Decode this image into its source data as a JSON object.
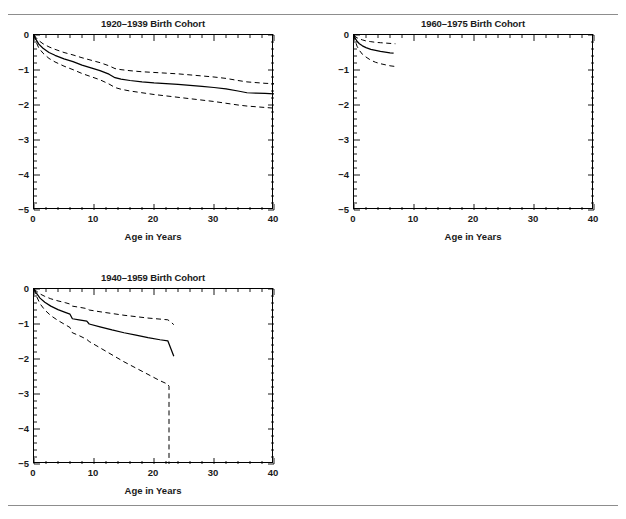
{
  "figure": {
    "top_fragment_text": "",
    "rules": {
      "color": "#8d8d8d"
    },
    "axis": {
      "xlabel": "Age in Years",
      "xticks": [
        0,
        10,
        20,
        30,
        40
      ],
      "xtick_labels": [
        "0",
        "10",
        "20",
        "30",
        "40"
      ],
      "yticks": [
        0,
        -1,
        -2,
        -3,
        -4,
        -5
      ],
      "ytick_labels": [
        "0",
        "−1",
        "−2",
        "−3",
        "−4",
        "−5"
      ],
      "xlim": [
        0,
        40
      ],
      "ylim": [
        -5,
        0
      ],
      "x_minor_per_major": 5,
      "y_minor_per_major": 5,
      "grid": false,
      "line_color": "#000000"
    }
  },
  "chart_data": [
    {
      "type": "line",
      "title": "1920–1939 Birth Cohort",
      "xlabel": "Age in Years",
      "ylabel": "",
      "xlim": [
        0,
        40
      ],
      "ylim": [
        -5,
        0
      ],
      "grid": false,
      "legend": "none",
      "series": [
        {
          "name": "estimate",
          "style": "solid",
          "x": [
            0,
            0.3,
            0.8,
            1.5,
            2.5,
            3.5,
            5,
            6.5,
            8,
            9.5,
            11,
            12.5,
            13.5,
            14.5,
            16,
            18,
            20,
            22,
            24,
            26,
            28,
            30,
            32,
            34,
            35.5,
            37,
            38.5,
            40
          ],
          "y": [
            0,
            -0.12,
            -0.26,
            -0.38,
            -0.5,
            -0.58,
            -0.68,
            -0.76,
            -0.86,
            -0.94,
            -1.02,
            -1.12,
            -1.22,
            -1.26,
            -1.3,
            -1.34,
            -1.37,
            -1.39,
            -1.41,
            -1.44,
            -1.47,
            -1.5,
            -1.54,
            -1.6,
            -1.65,
            -1.66,
            -1.67,
            -1.68
          ]
        },
        {
          "name": "upper_ci",
          "style": "dashed",
          "x": [
            0,
            0.3,
            0.8,
            1.5,
            2.5,
            3.5,
            5,
            6.5,
            8,
            9.5,
            11,
            12.5,
            13.5,
            14.5,
            16,
            18,
            20,
            22,
            24,
            26,
            28,
            30,
            32,
            34,
            35.5,
            37,
            38.5,
            40
          ],
          "y": [
            0,
            -0.07,
            -0.16,
            -0.25,
            -0.34,
            -0.41,
            -0.5,
            -0.57,
            -0.65,
            -0.72,
            -0.79,
            -0.88,
            -0.96,
            -0.99,
            -1.02,
            -1.05,
            -1.07,
            -1.09,
            -1.11,
            -1.14,
            -1.17,
            -1.2,
            -1.24,
            -1.3,
            -1.34,
            -1.36,
            -1.38,
            -1.39
          ]
        },
        {
          "name": "lower_ci",
          "style": "dashed",
          "x": [
            0,
            0.3,
            0.8,
            1.5,
            2.5,
            3.5,
            5,
            6.5,
            8,
            9.5,
            11,
            12.5,
            13.5,
            14.5,
            16,
            18,
            20,
            22,
            24,
            26,
            28,
            30,
            32,
            34,
            35.5,
            37,
            38.5,
            40
          ],
          "y": [
            0,
            -0.18,
            -0.37,
            -0.52,
            -0.67,
            -0.77,
            -0.89,
            -0.99,
            -1.1,
            -1.19,
            -1.28,
            -1.4,
            -1.5,
            -1.55,
            -1.6,
            -1.65,
            -1.7,
            -1.74,
            -1.78,
            -1.82,
            -1.86,
            -1.9,
            -1.95,
            -2.0,
            -2.03,
            -2.05,
            -2.07,
            -2.09
          ]
        }
      ]
    },
    {
      "type": "line",
      "title": "1960–1975 Birth Cohort",
      "xlabel": "Age in Years",
      "ylabel": "",
      "xlim": [
        0,
        40
      ],
      "ylim": [
        -5,
        0
      ],
      "grid": false,
      "legend": "none",
      "series": [
        {
          "name": "estimate",
          "style": "solid",
          "x": [
            0,
            0.2,
            0.5,
            0.9,
            1.4,
            2.0,
            2.8,
            3.6,
            4.4,
            5.2,
            6.0,
            6.6
          ],
          "y": [
            0,
            -0.09,
            -0.18,
            -0.25,
            -0.31,
            -0.36,
            -0.41,
            -0.44,
            -0.47,
            -0.49,
            -0.51,
            -0.52
          ]
        },
        {
          "name": "upper_ci",
          "style": "dashed",
          "x": [
            0,
            0.2,
            0.5,
            0.9,
            1.4,
            2.0,
            2.8,
            3.6,
            4.4,
            5.2,
            6.0,
            6.9
          ],
          "y": [
            0,
            -0.04,
            -0.08,
            -0.11,
            -0.14,
            -0.17,
            -0.19,
            -0.21,
            -0.22,
            -0.23,
            -0.24,
            -0.25
          ]
        },
        {
          "name": "lower_ci",
          "style": "dashed",
          "x": [
            0,
            0.2,
            0.5,
            0.9,
            1.4,
            2.0,
            2.8,
            3.6,
            4.4,
            5.2,
            6.0,
            6.9
          ],
          "y": [
            0,
            -0.16,
            -0.32,
            -0.44,
            -0.55,
            -0.63,
            -0.72,
            -0.78,
            -0.82,
            -0.85,
            -0.88,
            -0.9
          ]
        }
      ]
    },
    {
      "type": "line",
      "title": "1940–1959 Birth Cohort",
      "xlabel": "Age in Years",
      "ylabel": "",
      "xlim": [
        0,
        40
      ],
      "ylim": [
        -5,
        0
      ],
      "grid": false,
      "legend": "none",
      "series": [
        {
          "name": "estimate",
          "style": "solid",
          "x": [
            0,
            0.4,
            1.0,
            1.8,
            2.8,
            4.0,
            5.2,
            6.0,
            6.4,
            7.5,
            8.8,
            9.2,
            11,
            13,
            15,
            17,
            19,
            21,
            22.3,
            22.8,
            23.3
          ],
          "y": [
            0,
            -0.12,
            -0.26,
            -0.38,
            -0.49,
            -0.59,
            -0.67,
            -0.72,
            -0.85,
            -0.88,
            -0.92,
            -1.0,
            -1.08,
            -1.17,
            -1.25,
            -1.32,
            -1.39,
            -1.45,
            -1.48,
            -1.7,
            -1.92
          ]
        },
        {
          "name": "upper_ci",
          "style": "dashed",
          "x": [
            0,
            0.4,
            1.0,
            1.8,
            2.8,
            4.0,
            5.2,
            6.0,
            6.4,
            7.5,
            8.8,
            9.2,
            11,
            13,
            15,
            17,
            19,
            21,
            22.3,
            22.8,
            23.3
          ],
          "y": [
            0,
            -0.06,
            -0.14,
            -0.21,
            -0.28,
            -0.34,
            -0.39,
            -0.43,
            -0.49,
            -0.52,
            -0.56,
            -0.6,
            -0.65,
            -0.7,
            -0.75,
            -0.79,
            -0.83,
            -0.86,
            -0.88,
            -0.94,
            -1.02
          ]
        },
        {
          "name": "lower_ci",
          "style": "dashed",
          "x": [
            0,
            0.4,
            1.0,
            1.8,
            2.8,
            4.0,
            5.2,
            6.0,
            6.4,
            7.5,
            8.8,
            9.2,
            11,
            13,
            15,
            17,
            19,
            21,
            22.3,
            22.5,
            22.5
          ],
          "y": [
            0,
            -0.2,
            -0.42,
            -0.6,
            -0.76,
            -0.9,
            -1.02,
            -1.1,
            -1.25,
            -1.33,
            -1.44,
            -1.5,
            -1.68,
            -1.88,
            -2.08,
            -2.26,
            -2.44,
            -2.62,
            -2.72,
            -2.78,
            -5.0
          ]
        }
      ]
    }
  ],
  "panels": [
    {
      "id": "panel-1920-1939",
      "position": "top-left"
    },
    {
      "id": "panel-1960-1975",
      "position": "top-right"
    },
    {
      "id": "panel-1940-1959",
      "position": "bottom-left"
    }
  ]
}
